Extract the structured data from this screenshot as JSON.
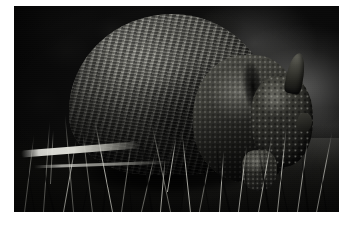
{
  "image": {
    "domain": "natural-image",
    "subject": "armadillo",
    "scene_description": "A nine-banded armadillo foraging in grass, photographed in profile facing right, with a dark blurred background",
    "orientation": "landscape",
    "width_px": 353,
    "height_px": 229,
    "border": {
      "style": "white matte border",
      "color": "#ffffff",
      "left_px": 14,
      "top_px": 6,
      "photo_width_px": 325,
      "photo_height_px": 206
    },
    "palette": {
      "background_dark": "#0b0b0b",
      "background_light": "#4a4a45",
      "shell_highlight": "#8a8a82",
      "shell_midtone": "#55554f",
      "shell_shadow": "#121210",
      "grass_highlight": "#e6e6de",
      "ground_shadow": "#0a0a09",
      "matte_white": "#ffffff"
    },
    "regions": [
      {
        "name": "background-upper-left",
        "description": "very dark mottled out-of-focus foliage"
      },
      {
        "name": "background-right",
        "description": "lighter grey blurred gradient, brightest toward right edge"
      },
      {
        "name": "armadillo-carapace",
        "description": "large banded domed armor shell occupying center-left"
      },
      {
        "name": "armadillo-rump-shield",
        "description": "pebbled scute pattern on the rear pelvic shield"
      },
      {
        "name": "armadillo-head",
        "description": "small scaled head lowered toward the ground at right"
      },
      {
        "name": "armadillo-ear",
        "description": "long pointed ear projecting upward behind the head"
      },
      {
        "name": "foreleg",
        "description": "stout scaled front leg and foot near the ground"
      },
      {
        "name": "grass-foreground",
        "description": "silhouetted grass blades across the lower third"
      },
      {
        "name": "bright-stem-streak",
        "description": "pale sunlit horizontal stem or log in the lower-left"
      }
    ],
    "caption": ""
  }
}
